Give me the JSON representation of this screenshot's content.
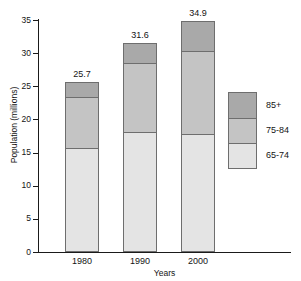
{
  "chart_data": {
    "type": "bar",
    "subtype": "stacked-bar",
    "title": "",
    "xlabel": "Years",
    "ylabel": "Population (millions)",
    "categories": [
      "1980",
      "1990",
      "2000"
    ],
    "ylim": [
      0,
      35
    ],
    "yticks": [
      0,
      5,
      10,
      15,
      20,
      25,
      30,
      35
    ],
    "ytick_labels": [
      "0",
      "5",
      "10",
      "15",
      "20",
      "25",
      "30",
      "35"
    ],
    "grid": false,
    "legend_position": "right",
    "series": [
      {
        "name": "65-74",
        "values": [
          15.8,
          18.3,
          18.0
        ],
        "color": "#e4e4e4"
      },
      {
        "name": "75-84",
        "values": [
          7.8,
          10.4,
          12.5
        ],
        "color": "#c4c4c4"
      },
      {
        "name": "85+",
        "values": [
          2.1,
          2.9,
          4.4
        ],
        "color": "#a9a9a9"
      }
    ],
    "totals": [
      25.7,
      31.6,
      34.9
    ],
    "total_labels": [
      "25.7",
      "31.6",
      "34.9"
    ],
    "legend_entries": [
      {
        "label": "85+",
        "color": "#a9a9a9"
      },
      {
        "label": "75-84",
        "color": "#c4c4c4"
      },
      {
        "label": "65-74",
        "color": "#e4e4e4"
      }
    ],
    "colors": {
      "axis": "#1a1a1a",
      "text": "#141414",
      "bar_outline": "#6e6e6e",
      "background": "#ffffff"
    }
  }
}
